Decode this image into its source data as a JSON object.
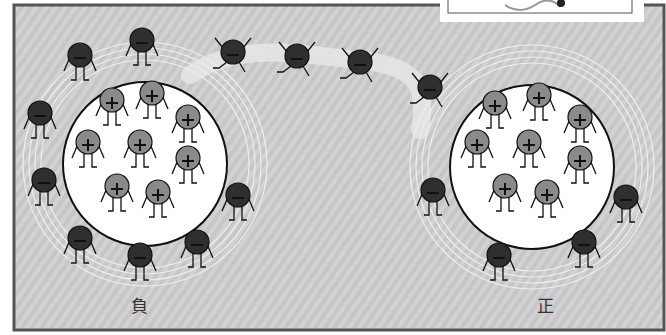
{
  "labels": {
    "negative": "負",
    "positive": "正"
  },
  "colors": {
    "background": "#c9c9c9",
    "frame": "#555555",
    "electron": "#2f2f2f",
    "proton": "#8a8a8a",
    "nucleus": "#ffffff"
  },
  "atoms": [
    {
      "name": "negative-atom",
      "cx": 145,
      "cy": 164,
      "r": 82,
      "protons": [
        [
          112,
          100
        ],
        [
          152,
          93
        ],
        [
          188,
          117
        ],
        [
          88,
          142
        ],
        [
          140,
          142
        ],
        [
          188,
          158
        ],
        [
          117,
          186
        ],
        [
          158,
          192
        ]
      ],
      "electrons": [
        [
          80,
          55
        ],
        [
          142,
          40
        ],
        [
          40,
          113
        ],
        [
          44,
          180
        ],
        [
          80,
          238
        ],
        [
          140,
          255
        ],
        [
          197,
          242
        ],
        [
          238,
          195
        ]
      ]
    },
    {
      "name": "positive-atom",
      "cx": 532,
      "cy": 167,
      "r": 82,
      "protons": [
        [
          495,
          103
        ],
        [
          539,
          95
        ],
        [
          580,
          117
        ],
        [
          477,
          142
        ],
        [
          529,
          142
        ],
        [
          580,
          158
        ],
        [
          505,
          186
        ],
        [
          547,
          192
        ]
      ],
      "electrons": [
        [
          433,
          190
        ],
        [
          499,
          255
        ],
        [
          584,
          242
        ],
        [
          626,
          197
        ]
      ]
    }
  ],
  "flying_electrons": [
    [
      233,
      52
    ],
    [
      297,
      56
    ],
    [
      360,
      62
    ],
    [
      430,
      87
    ]
  ]
}
